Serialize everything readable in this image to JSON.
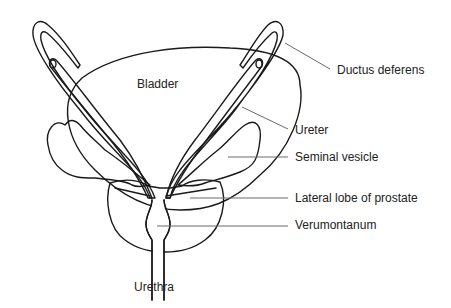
{
  "diagram": {
    "colors": {
      "bladder_fill": "#f4f4f4",
      "prostate_fill": "#d3d3d3",
      "vesicle_fill": "#ffffff",
      "outline": "#1a1a1a",
      "leader": "#6a6a6a",
      "text": "#222222"
    },
    "labels": {
      "bladder": "Bladder",
      "ductus_deferens": "Ductus deferens",
      "ureter": "Ureter",
      "seminal_vesicle": "Seminal vesicle",
      "lateral_lobe": "Lateral lobe of prostate",
      "verumontanum": "Verumontanum",
      "urethra": "Urethra"
    }
  }
}
